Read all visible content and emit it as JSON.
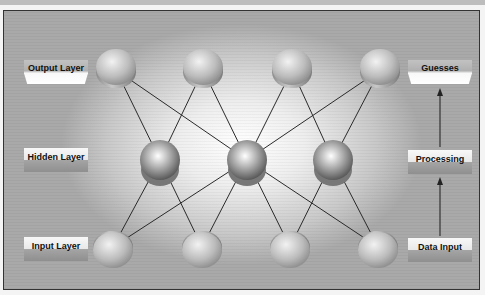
{
  "diagram": {
    "left_labels": [
      {
        "id": "output",
        "text": "Output Layer"
      },
      {
        "id": "hidden",
        "text": "Hidden Layer"
      },
      {
        "id": "input",
        "text": "Input Layer"
      }
    ],
    "right_labels": [
      {
        "id": "guesses",
        "text": "Guesses"
      },
      {
        "id": "processing",
        "text": "Processing"
      },
      {
        "id": "data_input",
        "text": "Data Input"
      }
    ],
    "flow": [
      "Data Input",
      "Processing",
      "Guesses"
    ],
    "nodes": {
      "output": [
        {
          "x": 116,
          "y": 70
        },
        {
          "x": 203,
          "y": 70
        },
        {
          "x": 292,
          "y": 70
        },
        {
          "x": 380,
          "y": 70
        }
      ],
      "hidden": [
        {
          "x": 160,
          "y": 160
        },
        {
          "x": 247,
          "y": 160
        },
        {
          "x": 333,
          "y": 160
        }
      ],
      "input": [
        {
          "x": 113,
          "y": 247
        },
        {
          "x": 202,
          "y": 247
        },
        {
          "x": 290,
          "y": 247
        },
        {
          "x": 378,
          "y": 247
        }
      ]
    },
    "connections": [
      [
        "output.0",
        "hidden.0"
      ],
      [
        "output.0",
        "hidden.1"
      ],
      [
        "output.1",
        "hidden.0"
      ],
      [
        "output.1",
        "hidden.1"
      ],
      [
        "output.2",
        "hidden.1"
      ],
      [
        "output.2",
        "hidden.2"
      ],
      [
        "output.3",
        "hidden.1"
      ],
      [
        "output.3",
        "hidden.2"
      ],
      [
        "input.0",
        "hidden.0"
      ],
      [
        "input.0",
        "hidden.1"
      ],
      [
        "input.1",
        "hidden.0"
      ],
      [
        "input.1",
        "hidden.1"
      ],
      [
        "input.2",
        "hidden.1"
      ],
      [
        "input.2",
        "hidden.2"
      ],
      [
        "input.3",
        "hidden.1"
      ],
      [
        "input.3",
        "hidden.2"
      ]
    ],
    "colors": {
      "line": "#2a2a2a",
      "frame_border": "#333333"
    }
  }
}
